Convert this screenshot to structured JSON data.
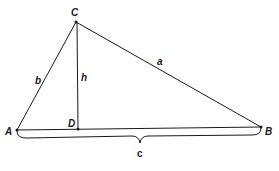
{
  "diagram": {
    "type": "triangle-with-altitude",
    "vertices": {
      "A": {
        "label": "A",
        "x": 17,
        "y": 130
      },
      "B": {
        "label": "B",
        "x": 261,
        "y": 127
      },
      "C": {
        "label": "C",
        "x": 76,
        "y": 22
      },
      "D": {
        "label": "D",
        "x": 78,
        "y": 129
      }
    },
    "sides": {
      "a": {
        "label": "a"
      },
      "b": {
        "label": "b"
      },
      "c": {
        "label": "c"
      },
      "h": {
        "label": "h"
      }
    },
    "colors": {
      "stroke": "#1a1a1a",
      "background": "#ffffff"
    }
  }
}
